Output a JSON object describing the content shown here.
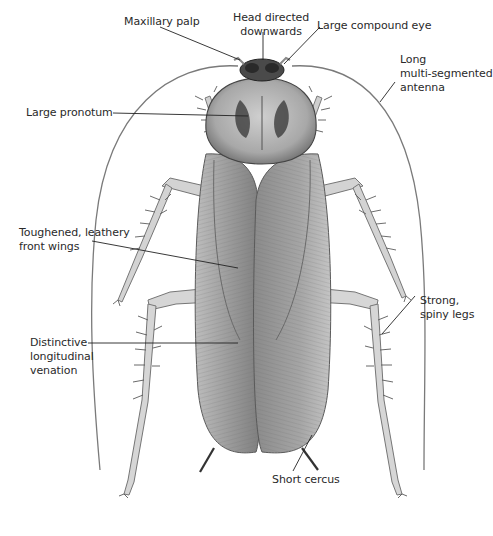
{
  "diagram": {
    "labels": {
      "maxillary_palp": "Maxillary palp",
      "head_line1": "Head directed",
      "head_line2": "downwards",
      "compound_eye": "Large compound eye",
      "antenna_line1": "Long",
      "antenna_line2": "multi-segmented",
      "antenna_line3": "antenna",
      "pronotum": "Large pronotum",
      "wings_line1": "Toughened, leathery",
      "wings_line2": "front wings",
      "venation_line1": "Distinctive",
      "venation_line2": "longitudinal",
      "venation_line3": "venation",
      "legs_line1": "Strong,",
      "legs_line2": "spiny legs",
      "cercus": "Short cercus"
    },
    "colors": {
      "background": "#ffffff",
      "text": "#2a2a2a",
      "leader_line": "#222222",
      "body_light": "#d4d4d4",
      "body_mid": "#a8a8a8",
      "body_dark": "#4a4a4a"
    }
  }
}
